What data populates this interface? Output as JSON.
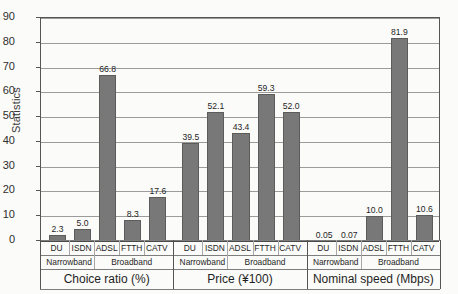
{
  "chart_data": {
    "type": "bar",
    "title": "",
    "ylabel": "Statistics",
    "xlabel": "",
    "ylim": [
      0,
      90
    ],
    "yticks": [
      0,
      10,
      20,
      30,
      40,
      50,
      60,
      70,
      80,
      90
    ],
    "grid": true,
    "legend": "none",
    "bar_color": "#787878",
    "panels": [
      {
        "title": "Choice ratio (%)",
        "bands": [
          {
            "label": "Narrowband",
            "categories": [
              "DU",
              "ISDN"
            ]
          },
          {
            "label": "Broadband",
            "categories": [
              "ADSL",
              "FTTH",
              "CATV"
            ]
          }
        ],
        "categories": [
          "DU",
          "ISDN",
          "ADSL",
          "FTTH",
          "CATV"
        ],
        "values": [
          2.3,
          5.0,
          66.8,
          8.3,
          17.6
        ],
        "value_labels": [
          "2.3",
          "5.0",
          "66.8",
          "8.3",
          "17.6"
        ]
      },
      {
        "title": "Price (¥100)",
        "bands": [
          {
            "label": "Narrowband",
            "categories": [
              "DU",
              "ISDN"
            ]
          },
          {
            "label": "Broadband",
            "categories": [
              "ADSL",
              "FTTH",
              "CATV"
            ]
          }
        ],
        "categories": [
          "DU",
          "ISDN",
          "ADSL",
          "FTTH",
          "CATV"
        ],
        "values": [
          39.5,
          52.1,
          43.4,
          59.3,
          52.0
        ],
        "value_labels": [
          "39.5",
          "52.1",
          "43.4",
          "59.3",
          "52.0"
        ]
      },
      {
        "title": "Nominal speed (Mbps)",
        "bands": [
          {
            "label": "Narrowband",
            "categories": [
              "DU",
              "ISDN"
            ]
          },
          {
            "label": "Broadband",
            "categories": [
              "ADSL",
              "FTTH",
              "CATV"
            ]
          }
        ],
        "categories": [
          "DU",
          "ISDN",
          "ADSL",
          "FTTH",
          "CATV"
        ],
        "values": [
          0.05,
          0.07,
          10.0,
          81.9,
          10.6
        ],
        "value_labels": [
          "0.05",
          "0.07",
          "10.0",
          "81.9",
          "10.6"
        ]
      }
    ]
  }
}
